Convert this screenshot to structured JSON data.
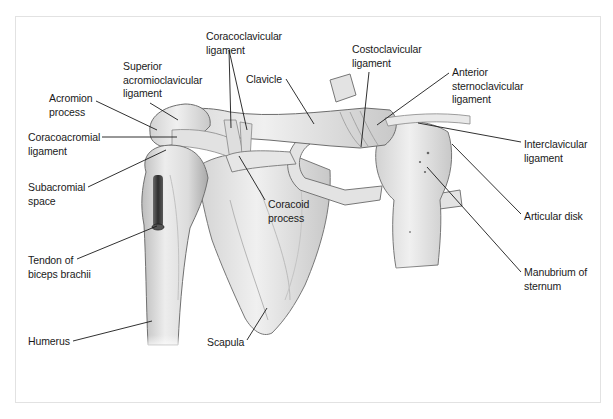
{
  "figure": {
    "type": "anatomical-illustration",
    "colors": {
      "bone": "#e6e6e6",
      "bone_shadow": "#b9b9b9",
      "outline": "#6d6d6d",
      "label": "#1a1a1a",
      "frame": "#e2e2e2",
      "tendon": "#3a3a3a"
    }
  },
  "labels": [
    {
      "id": "coracoclavicular-ligament",
      "text": "Coracoclavicular\nligament",
      "x": 206,
      "y": 30,
      "lines": [
        [
          229,
          50,
          231,
          128
        ],
        [
          229,
          50,
          247,
          130
        ]
      ]
    },
    {
      "id": "costoclavicular-ligament",
      "text": "Costoclavicular\nligament",
      "x": 352,
      "y": 43,
      "lines": [
        [
          369,
          72,
          361,
          147
        ]
      ]
    },
    {
      "id": "superior-acromioclavicular-ligament",
      "text": "Superior\nacromioclavicular\nligament",
      "x": 123,
      "y": 60,
      "lines": [
        [
          150,
          103,
          178,
          120
        ]
      ]
    },
    {
      "id": "clavicle",
      "text": "Clavicle",
      "x": 246,
      "y": 73,
      "lines": [
        [
          286,
          79,
          314,
          124
        ]
      ]
    },
    {
      "id": "anterior-sternoclavicular-ligament",
      "text": "Anterior\nsternoclavicular\nligament",
      "x": 452,
      "y": 66,
      "lines": [
        [
          449,
          73,
          377,
          125
        ]
      ]
    },
    {
      "id": "acromion-process",
      "text": "Acromion\nprocess",
      "x": 49,
      "y": 92,
      "lines": [
        [
          96,
          101,
          157,
          130
        ]
      ]
    },
    {
      "id": "coracoacromial-ligament",
      "text": "Coracoacromial\nligament",
      "x": 28,
      "y": 131,
      "lines": [
        [
          102,
          137,
          177,
          137
        ]
      ]
    },
    {
      "id": "interclavicular-ligament",
      "text": "Interclavicular\nligament",
      "x": 524,
      "y": 138,
      "lines": [
        [
          521,
          142,
          418,
          123
        ]
      ]
    },
    {
      "id": "subacromial-space",
      "text": "Subacromial\nspace",
      "x": 28,
      "y": 181,
      "lines": [
        [
          88,
          187,
          166,
          150
        ]
      ]
    },
    {
      "id": "coracoid-process",
      "text": "Coracoid\nprocess",
      "x": 268,
      "y": 198,
      "lines": [
        [
          265,
          200,
          239,
          156
        ]
      ]
    },
    {
      "id": "articular-disk",
      "text": "Articular disk",
      "x": 524,
      "y": 210,
      "lines": [
        [
          521,
          214,
          452,
          144
        ]
      ]
    },
    {
      "id": "tendon-of-biceps-brachii",
      "text": "Tendon of\nbiceps brachii",
      "x": 28,
      "y": 254,
      "lines": [
        [
          77,
          259,
          157,
          226
        ]
      ]
    },
    {
      "id": "manubrium-of-sternum",
      "text": "Manubrium of\nsternum",
      "x": 524,
      "y": 266,
      "lines": [
        [
          521,
          272,
          427,
          167
        ]
      ]
    },
    {
      "id": "humerus",
      "text": "Humerus",
      "x": 28,
      "y": 335,
      "lines": [
        [
          73,
          341,
          152,
          321
        ]
      ]
    },
    {
      "id": "scapula",
      "text": "Scapula",
      "x": 207,
      "y": 336,
      "lines": [
        [
          247,
          340,
          267,
          308
        ]
      ]
    }
  ]
}
